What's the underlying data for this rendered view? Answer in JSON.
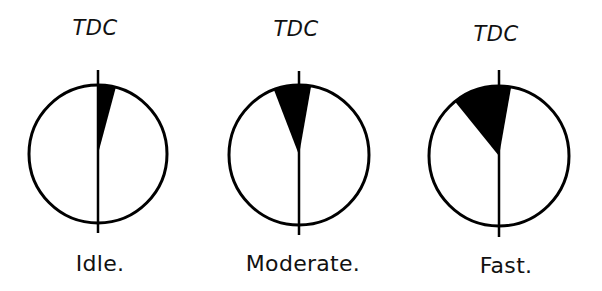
{
  "diagram": {
    "stroke_color": "#000000",
    "fill_color": "#000000",
    "background": "#ffffff",
    "panels": [
      {
        "id": "idle",
        "top_label": "TDC",
        "bottom_label": "Idle.",
        "center": [
          98,
          154
        ],
        "radius": 69,
        "line_top": 70,
        "line_bottom": 233,
        "wedge_start_deg": 0,
        "wedge_end_deg": 15,
        "tdc_label_pos": [
          95,
          18
        ],
        "bottom_label_pos": [
          100,
          253
        ]
      },
      {
        "id": "moderate",
        "top_label": "TDC",
        "bottom_label": "Moderate.",
        "center": [
          299,
          155
        ],
        "radius": 70,
        "line_top": 71,
        "line_bottom": 235,
        "wedge_start_deg": -21,
        "wedge_end_deg": 10,
        "tdc_label_pos": [
          296,
          19
        ],
        "bottom_label_pos": [
          303,
          253
        ]
      },
      {
        "id": "fast",
        "top_label": "TDC",
        "bottom_label": "Fast.",
        "center": [
          499,
          156
        ],
        "radius": 70,
        "line_top": 70,
        "line_bottom": 237,
        "wedge_start_deg": -39,
        "wedge_end_deg": 10,
        "tdc_label_pos": [
          496,
          24
        ],
        "bottom_label_pos": [
          506,
          255
        ]
      }
    ]
  }
}
